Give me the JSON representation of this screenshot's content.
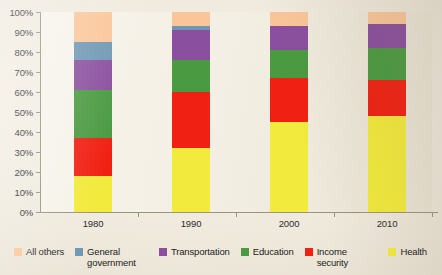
{
  "chart_data": {
    "type": "bar",
    "subtype": "stacked-percentage",
    "title": "",
    "xlabel": "",
    "ylabel": "",
    "categories": [
      "1980",
      "1990",
      "2000",
      "2010"
    ],
    "ylim": [
      0,
      100
    ],
    "ytick_labels": [
      "0%",
      "10%",
      "20%",
      "30%",
      "40%",
      "50%",
      "60%",
      "70%",
      "80%",
      "90%",
      "100%"
    ],
    "ytick_values": [
      0,
      10,
      20,
      30,
      40,
      50,
      60,
      70,
      80,
      90,
      100
    ],
    "grid": false,
    "legend_position": "bottom",
    "stack_order_bottom_to_top": [
      "Health",
      "Income security",
      "Education",
      "Transportation",
      "General government",
      "All others"
    ],
    "series": [
      {
        "name": "Health",
        "color": "#f2ea3c",
        "values": [
          18,
          32,
          45,
          48
        ]
      },
      {
        "name": "Income security",
        "color": "#f02012",
        "values": [
          19,
          28,
          22,
          18
        ]
      },
      {
        "name": "Education",
        "color": "#4a9a41",
        "values": [
          24,
          16,
          14,
          16
        ]
      },
      {
        "name": "Transportation",
        "color": "#8a4f9e",
        "values": [
          15,
          15,
          12,
          12
        ]
      },
      {
        "name": "General government",
        "color": "#6f97b3",
        "values": [
          9,
          2,
          0,
          0
        ]
      },
      {
        "name": "All others",
        "color": "#fac699",
        "values": [
          15,
          7,
          7,
          6
        ]
      }
    ],
    "cumulative_tops": {
      "1980": [
        18,
        37,
        61,
        76,
        85,
        100
      ],
      "1990": [
        32,
        60,
        76,
        91,
        93,
        100
      ],
      "2000": [
        45,
        67,
        81,
        93,
        93,
        100
      ],
      "2010": [
        48,
        66,
        82,
        94,
        94,
        100
      ]
    }
  },
  "legend": {
    "items": [
      {
        "label": "All others",
        "color": "#fac699"
      },
      {
        "label": "General government",
        "color": "#6f97b3"
      },
      {
        "label": "Transportation",
        "color": "#8a4f9e"
      },
      {
        "label": "Education",
        "color": "#4a9a41"
      },
      {
        "label": "Income security",
        "color": "#f02012"
      },
      {
        "label": "Health",
        "color": "#f2ea3c"
      }
    ]
  }
}
